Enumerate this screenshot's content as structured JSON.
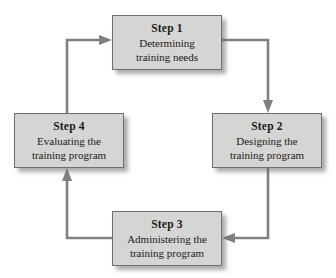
{
  "diagram": {
    "type": "cycle-flowchart",
    "colors": {
      "box_fill": "#d5d5d3",
      "box_border": "#6e6e6e",
      "connector": "#808080",
      "text": "#1a1a1a",
      "background": "#ffffff"
    },
    "steps": [
      {
        "id": "step-1",
        "title": "Step 1",
        "desc_line_1": "Determining",
        "desc_line_2": "training needs"
      },
      {
        "id": "step-2",
        "title": "Step 2",
        "desc_line_1": "Designing the",
        "desc_line_2": "training program"
      },
      {
        "id": "step-3",
        "title": "Step 3",
        "desc_line_1": "Administering the",
        "desc_line_2": "training program"
      },
      {
        "id": "step-4",
        "title": "Step 4",
        "desc_line_1": "Evaluating the",
        "desc_line_2": "training program"
      }
    ],
    "connectors": [
      {
        "id": "arrow-step1-to-step2",
        "from": "step-1",
        "to": "step-2",
        "direction": "down"
      },
      {
        "id": "arrow-step2-to-step3",
        "from": "step-2",
        "to": "step-3",
        "direction": "left"
      },
      {
        "id": "arrow-step3-to-step4",
        "from": "step-3",
        "to": "step-4",
        "direction": "up"
      },
      {
        "id": "arrow-step4-to-step1",
        "from": "step-4",
        "to": "step-1",
        "direction": "right"
      }
    ]
  }
}
